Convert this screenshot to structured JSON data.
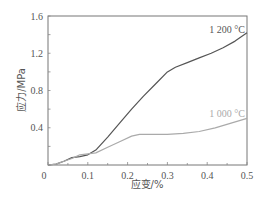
{
  "chart_data": {
    "type": "line",
    "title": "",
    "xlabel": "应变/%",
    "ylabel": "应力/MPa",
    "xlim": [
      0,
      0.5
    ],
    "ylim": [
      0,
      1.6
    ],
    "xticks": [
      0,
      0.1,
      0.2,
      0.3,
      0.4,
      0.5
    ],
    "xtick_labels": [
      "0",
      "0.1",
      "0.2",
      "0.3",
      "0.4",
      "0.5"
    ],
    "yticks": [
      0.4,
      0.8,
      1.2,
      1.6
    ],
    "ytick_labels": [
      "0.4",
      "0.8",
      "1.2",
      "1.6"
    ],
    "grid": false,
    "legend": "inline labels near line ends",
    "series": [
      {
        "name": "1 200 °C",
        "color": "#555555",
        "x": [
          0,
          0.02,
          0.04,
          0.06,
          0.08,
          0.1,
          0.12,
          0.15,
          0.18,
          0.21,
          0.24,
          0.27,
          0.3,
          0.32,
          0.35,
          0.38,
          0.41,
          0.44,
          0.47,
          0.5
        ],
        "y": [
          0,
          0.01,
          0.04,
          0.08,
          0.09,
          0.11,
          0.16,
          0.3,
          0.45,
          0.6,
          0.74,
          0.87,
          1.0,
          1.05,
          1.1,
          1.15,
          1.2,
          1.26,
          1.33,
          1.42
        ]
      },
      {
        "name": "1 000 °C",
        "color": "#aaaaaa",
        "x": [
          0,
          0.02,
          0.04,
          0.06,
          0.08,
          0.1,
          0.12,
          0.15,
          0.18,
          0.21,
          0.23,
          0.26,
          0.3,
          0.34,
          0.38,
          0.42,
          0.46,
          0.5
        ],
        "y": [
          0,
          0.01,
          0.04,
          0.07,
          0.11,
          0.12,
          0.13,
          0.19,
          0.25,
          0.31,
          0.33,
          0.33,
          0.33,
          0.34,
          0.36,
          0.4,
          0.45,
          0.5
        ]
      }
    ],
    "annotations": [
      {
        "text": "1 200 °C",
        "x": 0.45,
        "y": 1.45
      },
      {
        "text": "1 000 °C",
        "x": 0.45,
        "y": 0.55
      }
    ]
  }
}
